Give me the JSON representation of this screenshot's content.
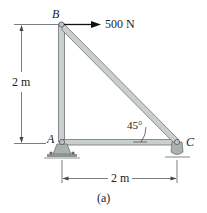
{
  "diagram": {
    "points": {
      "A": "A",
      "B": "B",
      "C": "C"
    },
    "force_label": "500 N",
    "angle_label": "45°",
    "height_dim": "2 m",
    "width_dim": "2 m",
    "caption": "(a)"
  }
}
